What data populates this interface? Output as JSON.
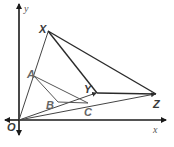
{
  "diagram": {
    "type": "geometry-dilation",
    "axes": {
      "x_label": "x",
      "y_label": "y",
      "origin_label": "O",
      "color": "#1a1a1a"
    },
    "triangle_image": {
      "vertices": [
        {
          "label": "X",
          "x": 48,
          "y": 31
        },
        {
          "label": "Y",
          "x": 97,
          "y": 93
        },
        {
          "label": "Z",
          "x": 156,
          "y": 94
        }
      ],
      "color": "#2a2a2a"
    },
    "triangle_preimage": {
      "vertices": [
        {
          "label": "A",
          "x": 34,
          "y": 76
        },
        {
          "label": "B",
          "x": 58,
          "y": 102
        },
        {
          "label": "C",
          "x": 88,
          "y": 103
        }
      ],
      "color": "#555555"
    },
    "rays": [
      {
        "from": "O",
        "to": "X"
      },
      {
        "from": "O",
        "to": "Y"
      },
      {
        "from": "O",
        "to": "Z"
      }
    ],
    "origin": {
      "x": 19,
      "y": 120
    }
  }
}
